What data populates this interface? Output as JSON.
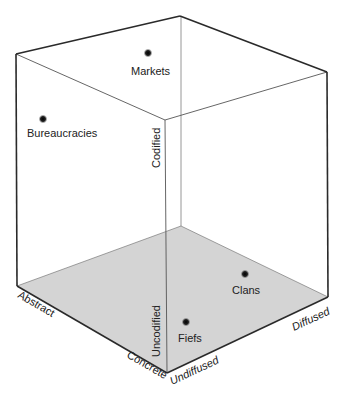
{
  "diagram": {
    "type": "3d-cube",
    "colors": {
      "edge": "#2a2a2a",
      "inner_edge": "#8a8a8a",
      "floor": "#d4d4d4",
      "dot": "#1a1a1a",
      "text": "#222222"
    },
    "axes": {
      "vertical_top": "Codified",
      "vertical_bottom": "Uncodified",
      "left_far": "Abstract",
      "left_near": "Concrete",
      "right_near": "Undiffused",
      "right_far": "Diffused"
    },
    "points": [
      {
        "label": "Markets",
        "x": 148,
        "y": 53
      },
      {
        "label": "Bureaucracies",
        "x": 43,
        "y": 119
      },
      {
        "label": "Clans",
        "x": 245,
        "y": 274
      },
      {
        "label": "Fiefs",
        "x": 186,
        "y": 322
      }
    ]
  }
}
